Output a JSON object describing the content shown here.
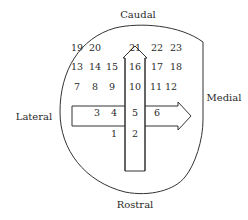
{
  "diagram": {
    "orientation_labels": {
      "top": "Caudal",
      "bottom": "Rostral",
      "left": "Lateral",
      "right": "Medial"
    },
    "arrows": [
      {
        "name": "caudal-arrow",
        "direction": "up"
      },
      {
        "name": "medial-arrow",
        "direction": "right"
      }
    ],
    "positions": [
      {
        "n": "19",
        "x": 77,
        "y": 47
      },
      {
        "n": "20",
        "x": 95,
        "y": 47
      },
      {
        "n": "21",
        "x": 135,
        "y": 47
      },
      {
        "n": "22",
        "x": 157,
        "y": 47
      },
      {
        "n": "23",
        "x": 176,
        "y": 47
      },
      {
        "n": "13",
        "x": 77,
        "y": 66
      },
      {
        "n": "14",
        "x": 95,
        "y": 66
      },
      {
        "n": "15",
        "x": 112,
        "y": 66
      },
      {
        "n": "16",
        "x": 135,
        "y": 66
      },
      {
        "n": "17",
        "x": 157,
        "y": 66
      },
      {
        "n": "18",
        "x": 176,
        "y": 66
      },
      {
        "n": "7",
        "x": 77,
        "y": 86
      },
      {
        "n": "8",
        "x": 95,
        "y": 86
      },
      {
        "n": "9",
        "x": 112,
        "y": 86
      },
      {
        "n": "10",
        "x": 135,
        "y": 86
      },
      {
        "n": "11",
        "x": 156,
        "y": 86
      },
      {
        "n": "12",
        "x": 171,
        "y": 86
      },
      {
        "n": "3",
        "x": 97,
        "y": 112
      },
      {
        "n": "4",
        "x": 114,
        "y": 112
      },
      {
        "n": "5",
        "x": 135,
        "y": 112
      },
      {
        "n": "6",
        "x": 157,
        "y": 112
      },
      {
        "n": "1",
        "x": 114,
        "y": 133
      },
      {
        "n": "2",
        "x": 135,
        "y": 133
      }
    ]
  }
}
